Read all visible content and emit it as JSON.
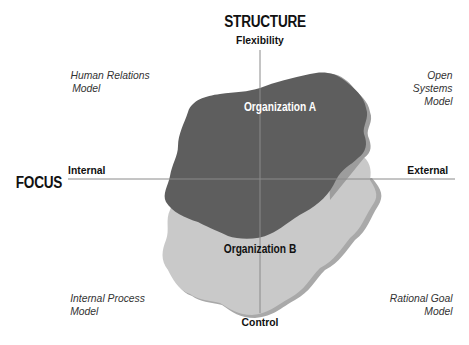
{
  "diagram": {
    "vertical_axis": {
      "title": "STRUCTURE",
      "top_label": "Flexibility",
      "bottom_label": "Control"
    },
    "horizontal_axis": {
      "title": "FOCUS",
      "left_label": "Internal",
      "right_label": "External"
    },
    "quadrants": {
      "top_left": [
        "Human Relations",
        "Model"
      ],
      "top_right": [
        "Open Systems",
        "Model"
      ],
      "bottom_left": [
        "Internal Process",
        "Model"
      ],
      "bottom_right": [
        "Rational Goal",
        "Model"
      ]
    },
    "shapes": [
      {
        "label": "Organization A",
        "fill": "#5e5e5e",
        "shadow": "#9a9a9a",
        "text_color": "#ffffff"
      },
      {
        "label": "Organization B",
        "fill": "#c9c9c9",
        "shadow": "#a8a8a8",
        "text_color": "#111111"
      }
    ],
    "axis_color": "#8a8a8a"
  }
}
